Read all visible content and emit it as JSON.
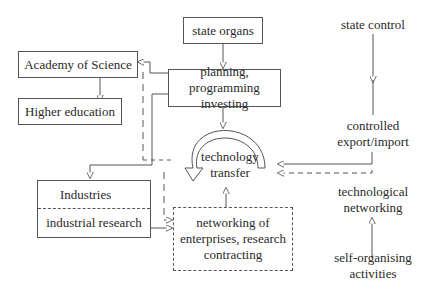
{
  "diagram": {
    "nodes": {
      "state_organs": "state organs",
      "academy": "Academy of Science",
      "higher_education": "Higher education",
      "planning_line1": "planning, programming",
      "planning_line2": "investing",
      "industries": "Industries",
      "industrial_research": "industrial research",
      "tech_transfer_line1": "technology",
      "tech_transfer_line2": "transfer",
      "networking_line1": "networking of",
      "networking_line2": "enterprises, research",
      "networking_line3": "contracting",
      "state_control": "state control",
      "controlled_line1": "controlled",
      "controlled_line2": "export/import",
      "tech_networking_line1": "technological",
      "tech_networking_line2": "networking",
      "self_org_line1": "self-organising",
      "self_org_line2": "activities"
    },
    "edges": [
      {
        "from": "state organs",
        "to": "planning, programming investing",
        "style": "solid"
      },
      {
        "from": "planning, programming investing",
        "to": "Academy of Science",
        "style": "solid"
      },
      {
        "from": "Academy of Science",
        "to": "Higher education",
        "style": "solid"
      },
      {
        "from": "planning, programming investing",
        "to": "technology transfer",
        "style": "solid"
      },
      {
        "from": "planning, programming investing",
        "to": "Industries",
        "style": "solid"
      },
      {
        "from": "networking of enterprises, research contracting",
        "to": "Academy of Science",
        "style": "dashed"
      },
      {
        "from": "industrial research",
        "to": "networking of enterprises, research contracting",
        "style": "solid"
      },
      {
        "from": "Industries",
        "to": "networking of enterprises, research contracting",
        "style": "dashed"
      },
      {
        "from": "networking of enterprises, research contracting",
        "to": "technology transfer",
        "style": "solid"
      },
      {
        "from": "state control",
        "to": "controlled export/import",
        "style": "solid"
      },
      {
        "from": "controlled export/import",
        "to": "technology transfer",
        "style": "solid"
      },
      {
        "from": "technological networking",
        "to": "technology transfer",
        "style": "dashed"
      },
      {
        "from": "self-organising activities",
        "to": "technological networking",
        "style": "solid"
      }
    ]
  }
}
